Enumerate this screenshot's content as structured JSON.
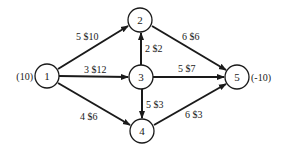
{
  "diagram": {
    "type": "network-flow",
    "nodes": [
      {
        "id": "1",
        "label": "1",
        "supply": "(10)",
        "x": 47,
        "y": 76
      },
      {
        "id": "2",
        "label": "2",
        "supply": "",
        "x": 140,
        "y": 20
      },
      {
        "id": "3",
        "label": "3",
        "supply": "",
        "x": 141,
        "y": 77
      },
      {
        "id": "4",
        "label": "4",
        "supply": "",
        "x": 142,
        "y": 131
      },
      {
        "id": "5",
        "label": "5",
        "supply": "(-10)",
        "x": 237,
        "y": 77
      }
    ],
    "edges": [
      {
        "from": "1",
        "to": "2",
        "label": "5 $10",
        "capacity": 5,
        "cost": 10
      },
      {
        "from": "1",
        "to": "3",
        "label": "3 $12",
        "capacity": 3,
        "cost": 12
      },
      {
        "from": "1",
        "to": "4",
        "label": "4 $6",
        "capacity": 4,
        "cost": 6
      },
      {
        "from": "3",
        "to": "2",
        "label": "2 $2",
        "capacity": 2,
        "cost": 2
      },
      {
        "from": "2",
        "to": "5",
        "label": "6 $6",
        "capacity": 6,
        "cost": 6
      },
      {
        "from": "3",
        "to": "5",
        "label": "5 $7",
        "capacity": 5,
        "cost": 7
      },
      {
        "from": "3",
        "to": "4",
        "label": "5 $3",
        "capacity": 5,
        "cost": 3
      },
      {
        "from": "4",
        "to": "5",
        "label": "6 $3",
        "capacity": 6,
        "cost": 3
      }
    ]
  }
}
